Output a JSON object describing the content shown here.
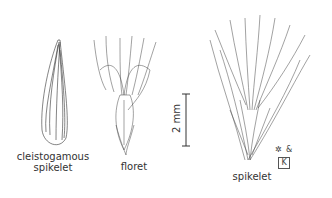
{
  "figures": [
    {
      "id": "cleistogamous-spikelet",
      "label_line1": "cleistogamous",
      "label_line2": "spikelet"
    },
    {
      "id": "floret",
      "label": "floret"
    },
    {
      "id": "spikelet",
      "label": "spikelet"
    }
  ],
  "scale_bar": {
    "label": "2 mm"
  },
  "signature": {
    "text": "&",
    "mark": "K"
  },
  "colors": {
    "ink": "#333333",
    "background": "#ffffff"
  }
}
